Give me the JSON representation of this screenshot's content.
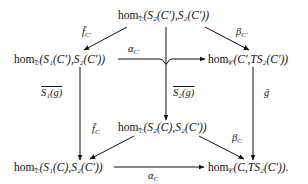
{
  "diagram": {
    "type": "commutative-diagram",
    "nodes": {
      "top": {
        "hom": "hom",
        "sub": "𝔇",
        "text": "(S₂(C′),S₂(C′))"
      },
      "mid_left": {
        "hom": "hom",
        "sub": "𝔇",
        "text": "(S₁(C′),S₂(C′))"
      },
      "mid_right": {
        "hom": "hom",
        "sub": "𝒞",
        "text": "(C′,TS₂(C′))"
      },
      "center": {
        "hom": "hom",
        "sub": "𝔇",
        "text": "(S₂(C),S₂(C′))"
      },
      "bot_left": {
        "hom": "hom",
        "sub": "𝔇",
        "text": "(S₁(C),S₂(C′))"
      },
      "bot_right": {
        "hom": "hom",
        "sub": "𝒞",
        "text": "(C,TS₂(C′))."
      }
    },
    "arrows": {
      "f_bar_Cprime": {
        "label": "f̄",
        "sub": "C′",
        "from": "top",
        "to": "mid_left"
      },
      "beta_Cprime": {
        "label": "β",
        "sub": "C′",
        "from": "top",
        "to": "mid_right"
      },
      "alpha_Cprime": {
        "label": "α",
        "sub": "C′",
        "from": "mid_left",
        "to": "mid_right"
      },
      "S1g_bar": {
        "label": "S₁(g)",
        "from": "mid_left",
        "to": "bot_left"
      },
      "S2g_bar": {
        "label": "S₂(g)",
        "from": "top",
        "to": "center"
      },
      "g_bar": {
        "label": "ḡ",
        "from": "mid_right",
        "to": "bot_right"
      },
      "f_bar_C": {
        "label": "f̄",
        "sub": "C",
        "from": "center",
        "to": "bot_left"
      },
      "beta_C": {
        "label": "β",
        "sub": "C",
        "from": "center",
        "to": "bot_right"
      },
      "alpha_C": {
        "label": "α",
        "sub": "C",
        "from": "bot_left",
        "to": "bot_right"
      }
    },
    "colors": {
      "ink": "#111111",
      "background": "#ffffff"
    }
  }
}
